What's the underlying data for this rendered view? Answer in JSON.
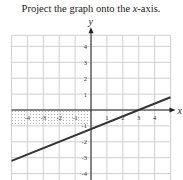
{
  "problem": {
    "prefix": "Project the graph onto the ",
    "italic": "x",
    "suffix": "-axis."
  },
  "chart_data": {
    "type": "line",
    "title": "Project the graph onto the x-axis.",
    "xlabel": "x",
    "ylabel": "y",
    "xlim": [
      -5,
      5
    ],
    "ylim": [
      -4.5,
      5
    ],
    "grid": true,
    "x_ticks": [
      -4,
      -3,
      -2,
      -1,
      1,
      2,
      3,
      4
    ],
    "y_ticks": [
      4,
      3,
      2,
      1,
      -1,
      -2,
      -3,
      -4
    ],
    "x_tick_labels": [
      "-4",
      "-3",
      "-2",
      "-1",
      "1",
      "2",
      "3",
      "4"
    ],
    "y_tick_labels": [
      "4",
      "3",
      "2",
      "1",
      "-1",
      "-2",
      "-3",
      "-4"
    ],
    "series": [
      {
        "name": "line",
        "x": [
          -5,
          5
        ],
        "y": [
          -3.2,
          0.8
        ]
      }
    ],
    "shaded_region": {
      "x": [
        -5,
        0
      ],
      "y": [
        -1,
        0
      ],
      "style": "dotted-hatch"
    },
    "colors": {
      "grid": "#cfcfcf",
      "axis": "#222222",
      "line": "#333333",
      "shade": "#bdbdbd"
    }
  }
}
